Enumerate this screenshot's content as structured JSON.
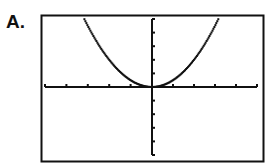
{
  "figure": {
    "label": "A."
  },
  "chart_data": {
    "type": "line",
    "title": "",
    "xlabel": "",
    "ylabel": "",
    "series": [
      {
        "name": "y = x^2",
        "style": "dotted/pixelated",
        "x": [
          -3.25,
          -3,
          -2.5,
          -2,
          -1.5,
          -1,
          -0.5,
          0,
          0.5,
          1,
          1.5,
          2,
          2.5,
          3,
          3.25
        ],
        "y": [
          10.6,
          9,
          6.25,
          4,
          2.25,
          1,
          0.25,
          0,
          0.25,
          1,
          2.25,
          4,
          6.25,
          9,
          10.6
        ]
      }
    ],
    "xlim": [
      -5,
      5
    ],
    "ylim": [
      -10,
      10
    ],
    "x_ticks_count_each_side": 5,
    "y_ticks_count_each_side": 5,
    "grid": false,
    "legend": null
  },
  "colors": {
    "ink": "#111111",
    "background": "#ffffff"
  }
}
